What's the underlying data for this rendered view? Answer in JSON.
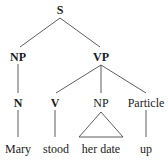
{
  "tree": {
    "root": "S",
    "level1": {
      "left": "NP",
      "right": "VP"
    },
    "level2": {
      "n": "N",
      "v": "V",
      "np": "NP",
      "particle": "Particle"
    },
    "leaves": {
      "mary": "Mary",
      "stood": "stood",
      "her_date": "her date",
      "up": "up"
    },
    "triangle_under": "NP"
  }
}
